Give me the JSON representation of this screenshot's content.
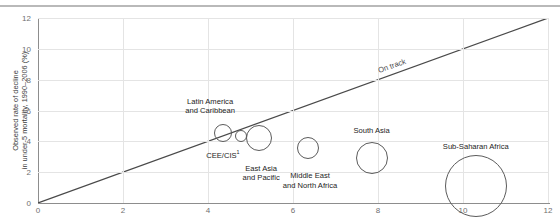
{
  "chart_data": {
    "type": "scatter",
    "title": "",
    "xlabel": "",
    "ylabel": "Observed rate of decline\nin under-5 mortality, 1990–2006 (%)",
    "xlim": [
      0,
      12
    ],
    "ylim": [
      0,
      12
    ],
    "xticks": [
      "0",
      "2",
      "4",
      "6",
      "8",
      "10",
      "12"
    ],
    "yticks": [
      "0",
      "2",
      "4",
      "6",
      "8",
      "10",
      "12"
    ],
    "xtick_values": [
      0,
      2,
      4,
      6,
      8,
      10,
      12
    ],
    "ytick_values": [
      0,
      2,
      4,
      6,
      8,
      10,
      12
    ],
    "grid": true,
    "legend": "none",
    "reference_line": {
      "label": "On track",
      "from": [
        0,
        0
      ],
      "to": [
        12,
        12
      ],
      "note": "y = x diagonal; regions above the line are on track"
    },
    "bubbles": [
      {
        "name": "Latin America and Caribbean",
        "label": "Latin America\nand Caribbean",
        "x": 4.35,
        "y": 4.55,
        "r_px": 9,
        "label_x": 4.05,
        "label_y": 6.9,
        "label_align": "center"
      },
      {
        "name": "CEE/CIS",
        "label": "CEE/CIS",
        "superscript": "1",
        "x": 4.78,
        "y": 4.35,
        "r_px": 6,
        "label_x": 4.35,
        "label_y": 3.35,
        "label_align": "center"
      },
      {
        "name": "East Asia and Pacific",
        "label": "East Asia\nand Pacific",
        "x": 5.2,
        "y": 4.2,
        "r_px": 13,
        "label_x": 5.25,
        "label_y": 2.55,
        "label_align": "center"
      },
      {
        "name": "Middle East and North Africa",
        "label": "Middle East\nand North Africa",
        "x": 6.35,
        "y": 3.55,
        "r_px": 11,
        "label_x": 6.4,
        "label_y": 2.05,
        "label_align": "center"
      },
      {
        "name": "South Asia",
        "label": "South Asia",
        "x": 7.85,
        "y": 2.95,
        "r_px": 16,
        "label_x": 7.85,
        "label_y": 5.0,
        "label_align": "center"
      },
      {
        "name": "Sub-Saharan Africa",
        "label": "Sub-Saharan Africa",
        "x": 10.3,
        "y": 1.1,
        "r_px": 31,
        "label_x": 10.3,
        "label_y": 3.95,
        "label_align": "center"
      }
    ]
  },
  "colors": {
    "axis": "#8d8d8d",
    "grid": "#e4e4e4",
    "bubble_stroke": "#5b5b5b",
    "reference_line": "#4a4a4a",
    "text": "#232323",
    "tick_text": "#6f6f6f",
    "top_rule": "#b9b9b9",
    "background": "#ffffff"
  }
}
